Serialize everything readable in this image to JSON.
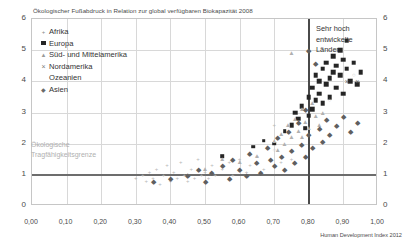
{
  "chart_data": {
    "type": "scatter",
    "title": "Ökologischer Fußabdruck in Relation zur global verfügbaren Biokapazität 2008",
    "xlabel": "Human Development Index 2012",
    "ylabel": "",
    "xlim": [
      0.0,
      1.0
    ],
    "ylim": [
      0,
      6
    ],
    "xticks": [
      "0,00",
      "0,10",
      "0,20",
      "0,30",
      "0,40",
      "0,50",
      "0,60",
      "0,70",
      "0,80",
      "0,90",
      "1,00"
    ],
    "yticks": [
      "0",
      "1",
      "2",
      "3",
      "4",
      "5",
      "6"
    ],
    "grid": true,
    "legend_position": "top-left",
    "annotations": [
      {
        "name": "carrying-capacity",
        "text_lines": [
          "Ökologische",
          "Tragfähigkeitsgrenze"
        ],
        "y_value": 1
      },
      {
        "name": "highly-developed",
        "text_lines": [
          "Sehr hoch",
          "entwickelte",
          "Länder"
        ],
        "x_value": 0.8
      }
    ],
    "reference_lines": [
      {
        "name": "carrying-capacity-line",
        "axis": "y",
        "value": 1,
        "color": "#6d6d6d"
      },
      {
        "name": "hdi-threshold-line",
        "axis": "x",
        "value": 0.8,
        "color": "#4a4a4a"
      }
    ],
    "series": [
      {
        "name": "Afrika",
        "marker": "plus",
        "color": "#b8b8b8",
        "points": [
          [
            0.3,
            0.9
          ],
          [
            0.32,
            1.0
          ],
          [
            0.33,
            0.8
          ],
          [
            0.34,
            1.1
          ],
          [
            0.35,
            0.9
          ],
          [
            0.36,
            1.2
          ],
          [
            0.37,
            0.7
          ],
          [
            0.38,
            1.0
          ],
          [
            0.39,
            1.3
          ],
          [
            0.4,
            0.8
          ],
          [
            0.41,
            1.1
          ],
          [
            0.42,
            0.9
          ],
          [
            0.43,
            1.4
          ],
          [
            0.44,
            1.0
          ],
          [
            0.45,
            0.8
          ],
          [
            0.46,
            1.2
          ],
          [
            0.47,
            0.9
          ],
          [
            0.48,
            1.5
          ],
          [
            0.49,
            1.0
          ],
          [
            0.5,
            1.1
          ],
          [
            0.51,
            0.9
          ],
          [
            0.52,
            1.3
          ],
          [
            0.53,
            1.0
          ],
          [
            0.55,
            1.2
          ],
          [
            0.57,
            1.4
          ],
          [
            0.58,
            1.0
          ],
          [
            0.6,
            1.5
          ],
          [
            0.62,
            1.1
          ],
          [
            0.63,
            1.3
          ],
          [
            0.65,
            1.6
          ],
          [
            0.67,
            1.2
          ],
          [
            0.7,
            2.6
          ],
          [
            0.72,
            1.4
          ],
          [
            0.75,
            1.5
          ]
        ]
      },
      {
        "name": "Europa",
        "marker": "square",
        "color": "#252525",
        "points": [
          [
            0.7,
            2.0
          ],
          [
            0.73,
            2.4
          ],
          [
            0.75,
            2.6
          ],
          [
            0.76,
            3.0
          ],
          [
            0.77,
            2.8
          ],
          [
            0.78,
            3.2
          ],
          [
            0.79,
            2.5
          ],
          [
            0.8,
            3.5
          ],
          [
            0.8,
            2.9
          ],
          [
            0.81,
            3.8
          ],
          [
            0.81,
            3.1
          ],
          [
            0.82,
            4.2
          ],
          [
            0.82,
            3.4
          ],
          [
            0.83,
            3.6
          ],
          [
            0.83,
            4.0
          ],
          [
            0.84,
            3.3
          ],
          [
            0.84,
            4.4
          ],
          [
            0.85,
            3.9
          ],
          [
            0.85,
            4.6
          ],
          [
            0.86,
            4.1
          ],
          [
            0.86,
            3.5
          ],
          [
            0.87,
            4.8
          ],
          [
            0.87,
            4.3
          ],
          [
            0.88,
            3.8
          ],
          [
            0.88,
            4.5
          ],
          [
            0.89,
            5.0
          ],
          [
            0.89,
            4.2
          ],
          [
            0.9,
            4.7
          ],
          [
            0.9,
            3.6
          ],
          [
            0.91,
            5.3
          ],
          [
            0.91,
            4.4
          ],
          [
            0.92,
            4.0
          ],
          [
            0.93,
            4.6
          ],
          [
            0.94,
            3.9
          ],
          [
            0.95,
            4.3
          ],
          [
            0.55,
            1.6
          ],
          [
            0.64,
            1.9
          ],
          [
            0.67,
            2.1
          ]
        ]
      },
      {
        "name": "Süd- und Mittelamerika",
        "marker": "triangle",
        "color": "#b0b0b0",
        "points": [
          [
            0.45,
            1.0
          ],
          [
            0.5,
            1.2
          ],
          [
            0.55,
            1.5
          ],
          [
            0.6,
            1.4
          ],
          [
            0.63,
            1.7
          ],
          [
            0.65,
            1.6
          ],
          [
            0.68,
            1.9
          ],
          [
            0.7,
            2.1
          ],
          [
            0.71,
            1.8
          ],
          [
            0.72,
            2.3
          ],
          [
            0.73,
            2.0
          ],
          [
            0.74,
            2.6
          ],
          [
            0.75,
            2.2
          ],
          [
            0.76,
            2.8
          ],
          [
            0.77,
            2.4
          ],
          [
            0.78,
            3.1
          ],
          [
            0.79,
            2.7
          ],
          [
            0.8,
            2.5
          ],
          [
            0.81,
            3.3
          ],
          [
            0.82,
            2.9
          ],
          [
            0.84,
            3.0
          ],
          [
            0.75,
            4.9
          ],
          [
            0.78,
            2.2
          ],
          [
            0.83,
            2.6
          ]
        ]
      },
      {
        "name": "Nordamerika",
        "marker": "x",
        "color": "#6a6a6a",
        "points": [
          [
            0.91,
            4.0
          ],
          [
            0.94,
            4.0
          ]
        ]
      },
      {
        "name": "Ozeanien",
        "marker": "circle",
        "color": "#c2c2c2",
        "points": [
          [
            0.7,
            1.8
          ],
          [
            0.86,
            3.4
          ],
          [
            0.93,
            4.2
          ]
        ]
      },
      {
        "name": "Asien",
        "marker": "diamond",
        "color": "#5f5f5f",
        "points": [
          [
            0.35,
            0.8
          ],
          [
            0.4,
            0.9
          ],
          [
            0.45,
            1.0
          ],
          [
            0.48,
            1.2
          ],
          [
            0.5,
            0.8
          ],
          [
            0.52,
            1.1
          ],
          [
            0.55,
            1.3
          ],
          [
            0.57,
            0.9
          ],
          [
            0.58,
            1.5
          ],
          [
            0.6,
            1.2
          ],
          [
            0.62,
            1.0
          ],
          [
            0.63,
            1.7
          ],
          [
            0.65,
            1.4
          ],
          [
            0.66,
            1.1
          ],
          [
            0.68,
            1.9
          ],
          [
            0.69,
            1.5
          ],
          [
            0.7,
            1.3
          ],
          [
            0.71,
            2.2
          ],
          [
            0.72,
            1.6
          ],
          [
            0.73,
            1.2
          ],
          [
            0.74,
            2.4
          ],
          [
            0.75,
            1.8
          ],
          [
            0.76,
            1.4
          ],
          [
            0.77,
            2.7
          ],
          [
            0.78,
            2.0
          ],
          [
            0.79,
            1.6
          ],
          [
            0.79,
            3.1
          ],
          [
            0.8,
            2.3
          ],
          [
            0.8,
            5.0
          ],
          [
            0.81,
            1.9
          ],
          [
            0.82,
            4.6
          ],
          [
            0.83,
            2.5
          ],
          [
            0.84,
            2.1
          ],
          [
            0.85,
            2.8
          ],
          [
            0.86,
            2.3
          ],
          [
            0.88,
            2.6
          ],
          [
            0.9,
            2.9
          ],
          [
            0.92,
            2.4
          ],
          [
            0.94,
            2.7
          ]
        ]
      }
    ]
  },
  "legend": {
    "items": [
      {
        "label": "Afrika",
        "glyph": "+",
        "cls": "af"
      },
      {
        "label": "Europa",
        "glyph": "■",
        "cls": "sq"
      },
      {
        "label": "Süd- und Mittelamerika",
        "glyph": "▲",
        "cls": "tr"
      },
      {
        "label": "Nordamerika",
        "glyph": "×",
        "cls": "xx"
      },
      {
        "label": "Ozeanien",
        "glyph": "",
        "cls": "ci"
      },
      {
        "label": "Asien",
        "glyph": "◆",
        "cls": "di"
      }
    ]
  }
}
